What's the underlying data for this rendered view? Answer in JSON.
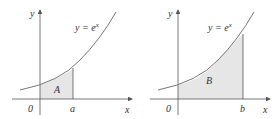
{
  "figures": [
    {
      "name": "area-A",
      "curve_label": "y = e",
      "curve_exponent": "x",
      "region_label": "A",
      "origin_label": "0",
      "bound_label": "a",
      "x_axis_label": "x",
      "y_axis_label": "y"
    },
    {
      "name": "area-B",
      "curve_label": "y = e",
      "curve_exponent": "x",
      "region_label": "B",
      "origin_label": "0",
      "bound_label": "b",
      "x_axis_label": "x",
      "y_axis_label": "y"
    }
  ],
  "colors": {
    "shade": "#e6e6e6",
    "curve": "#666666",
    "axis": "#555555"
  }
}
